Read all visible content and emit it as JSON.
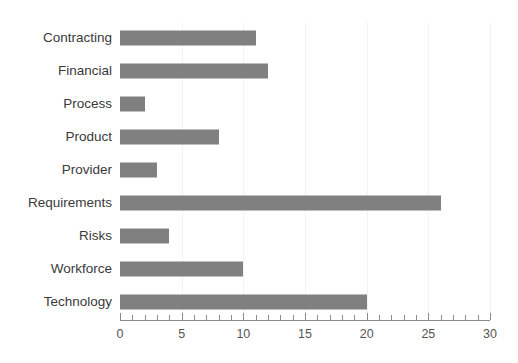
{
  "chart_data": {
    "type": "bar",
    "orientation": "horizontal",
    "title": "",
    "xlabel": "",
    "ylabel": "",
    "categories": [
      "Contracting",
      "Financial",
      "Process",
      "Product",
      "Provider",
      "Requirements",
      "Risks",
      "Workforce",
      "Technology"
    ],
    "values": [
      11,
      12,
      2,
      8,
      3,
      26,
      4,
      10,
      20
    ],
    "xlim": [
      0,
      30
    ],
    "xticks": [
      0,
      5,
      10,
      15,
      20,
      25,
      30
    ],
    "xtick_labels": [
      "0",
      "5",
      "10",
      "15",
      "20",
      "25",
      "30"
    ],
    "minor_tick_step": 1,
    "grid": true,
    "grid_axis": "x",
    "legend": false,
    "bar_color": "#808080",
    "grid_color": "#f2f2f2",
    "axis_color": "#8a8a8a",
    "label_color": "#3a3a3a",
    "tick_label_color": "#555555",
    "background": "#ffffff"
  }
}
